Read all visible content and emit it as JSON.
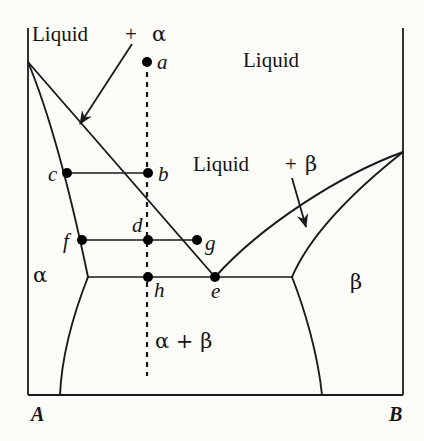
{
  "figure": {
    "type": "binary-eutectic-phase-diagram",
    "axes": {
      "left_component": "A",
      "right_component": "B",
      "left_component_x": 28,
      "right_component_x": 403,
      "baseline_y": 395,
      "top_y": 28
    }
  },
  "region_labels": [
    {
      "id": "liquid-alpha",
      "text": "Liquid",
      "plus": "+",
      "phase": "α",
      "x": 32,
      "y": 24,
      "plus_x": 125,
      "phase_x": 152
    },
    {
      "id": "liquid-top",
      "text": "Liquid",
      "x": 243,
      "y": 50
    },
    {
      "id": "liquid-beta",
      "text": "Liquid",
      "plus": "+",
      "phase": "β",
      "x": 193,
      "y": 154,
      "plus_x": 285,
      "phase_x": 305
    },
    {
      "id": "alpha",
      "text": "α",
      "x": 33,
      "y": 265
    },
    {
      "id": "beta",
      "text": "β",
      "x": 350,
      "y": 272
    },
    {
      "id": "alpha-beta",
      "text": "α + β",
      "x": 155,
      "y": 331
    }
  ],
  "axis_labels": [
    {
      "id": "component-a",
      "text": "A",
      "x": 31,
      "y": 404
    },
    {
      "id": "component-b",
      "text": "B",
      "x": 389,
      "y": 404
    }
  ],
  "points": [
    {
      "id": "a",
      "label": "a",
      "x": 147,
      "y": 62,
      "label_x": 157,
      "label_y": 52
    },
    {
      "id": "b",
      "label": "b",
      "x": 148,
      "y": 173,
      "label_x": 158,
      "label_y": 164
    },
    {
      "id": "c",
      "label": "c",
      "x": 67,
      "y": 173,
      "label_x": 48,
      "label_y": 164
    },
    {
      "id": "d",
      "label": "d",
      "x": 148,
      "y": 240,
      "label_x": 132,
      "label_y": 215
    },
    {
      "id": "f",
      "label": "f",
      "x": 82,
      "y": 240,
      "label_x": 63,
      "label_y": 231
    },
    {
      "id": "g",
      "label": "g",
      "x": 197,
      "y": 240,
      "label_x": 205,
      "label_y": 233
    },
    {
      "id": "h",
      "label": "h",
      "x": 148,
      "y": 277,
      "label_x": 154,
      "label_y": 280
    },
    {
      "id": "e",
      "label": "e",
      "x": 215,
      "y": 277,
      "label_x": 211,
      "label_y": 281
    }
  ],
  "curves": {
    "liquidus_left": "M 28,62 L 215,277",
    "liquidus_right": "M 403,152 C 340,175 262,225 215,277",
    "solidus_left": "M 28,62 C 52,120 72,200 88,277",
    "solvus_left": "M 88,277 C 75,310 62,350 60,395",
    "solvus_right": "M 292,277 C 305,310 318,355 322,395",
    "beta_solidus": "M 403,152 C 355,190 310,235 292,277",
    "tie_line_cb": "M 67,173 L 148,173",
    "tie_line_fg": "M 82,240 L 197,240",
    "eutectic_line": "M 88,277 L 292,277",
    "isopleth_dashed": "M 147,62 L 147,376",
    "arrow_liquid_alpha": "M 132,44 L 80,124",
    "arrow_liquid_beta": "M 292,178 L 306,227"
  },
  "style": {
    "line_color": "#1a1a1a",
    "background": "#fbfbf8",
    "point_color": "#000000",
    "line_width": 1.8,
    "point_radius": 5
  }
}
